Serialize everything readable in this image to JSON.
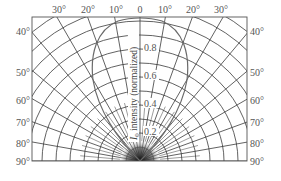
{
  "diagram": {
    "type": "polar-intensity-pattern",
    "top_angle_labels": [
      "30°",
      "20°",
      "10°",
      "0",
      "10°",
      "20°",
      "30°"
    ],
    "side_angle_labels": [
      "40°",
      "50°",
      "60°",
      "70°",
      "80°",
      "90°"
    ],
    "radial_tick_labels": [
      "0.2",
      "0.4",
      "0.6",
      "0.8"
    ],
    "axis_title_symbol": "I",
    "axis_title_subscript": "0",
    "axis_title_text": " intensity (normalized)",
    "colors": {
      "grid": "#3a3a3a",
      "curve": "#6a6a6a",
      "text": "#555555",
      "frame": "#555555"
    }
  }
}
